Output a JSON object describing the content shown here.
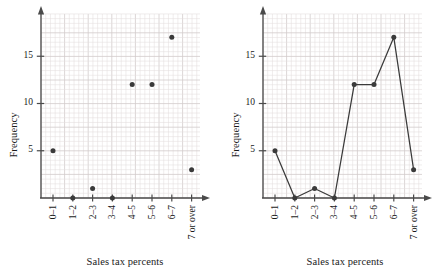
{
  "chart_data": [
    {
      "type": "scatter",
      "title": "",
      "xlabel": "Sales tax percents",
      "ylabel": "Frequency",
      "categories": [
        "0–1",
        "1–2",
        "2–3",
        "3–4",
        "4–5",
        "5–6",
        "6–7",
        "7 or over"
      ],
      "values": [
        5,
        0,
        1,
        0,
        12,
        12,
        17,
        3
      ],
      "ytick_labels": [
        "5",
        "10",
        "15"
      ],
      "yticks": [
        5,
        10,
        15
      ],
      "ylim": [
        0,
        18
      ],
      "grid": true,
      "legend": "none",
      "marker_color": "#3a3a3a",
      "grid_color": "#e3dede",
      "grid_major_color": "#d2cccc",
      "axis_color": "#4a4a4a"
    },
    {
      "type": "line",
      "title": "",
      "xlabel": "Sales tax percents",
      "ylabel": "Frequency",
      "categories": [
        "0–1",
        "1–2",
        "2–3",
        "3–4",
        "4–5",
        "5–6",
        "6–7",
        "7 or over"
      ],
      "values": [
        5,
        0,
        1,
        0,
        12,
        12,
        17,
        3
      ],
      "ytick_labels": [
        "5",
        "10",
        "15"
      ],
      "yticks": [
        5,
        10,
        15
      ],
      "ylim": [
        0,
        18
      ],
      "grid": true,
      "legend": "none",
      "line_color": "#3a3a3a",
      "marker_color": "#3a3a3a",
      "grid_color": "#e3dede",
      "grid_major_color": "#d2cccc",
      "axis_color": "#4a4a4a"
    }
  ],
  "panels": [
    {
      "name": "scatter-plot",
      "xlabel": "Sales tax percents",
      "ylabel": "Frequency",
      "xticks": [
        "0–1",
        "1–2",
        "2–3",
        "3–4",
        "4–5",
        "5–6",
        "6–7",
        "7 or over"
      ],
      "yticks": [
        "5",
        "10",
        "15"
      ]
    },
    {
      "name": "line-graph",
      "xlabel": "Sales tax percents",
      "ylabel": "Frequency",
      "xticks": [
        "0–1",
        "1–2",
        "2–3",
        "3–4",
        "4–5",
        "5–6",
        "6–7",
        "7 or over"
      ],
      "yticks": [
        "5",
        "10",
        "15"
      ]
    }
  ]
}
